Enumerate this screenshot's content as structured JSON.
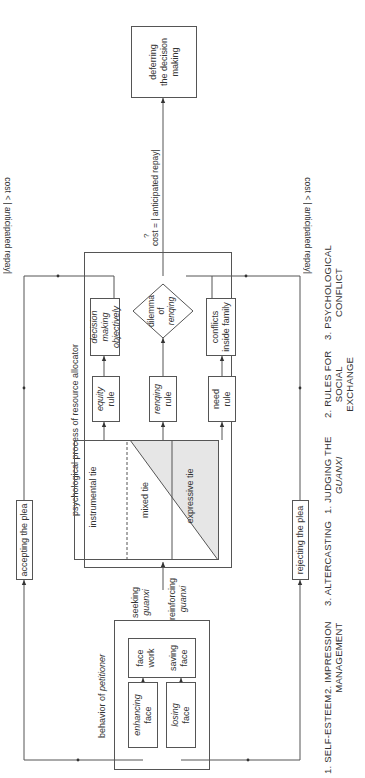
{
  "diagram": {
    "petitioner": {
      "title_prefix": "behavior of ",
      "title_italic": "petitioner",
      "enhancing_face": {
        "italic": "enhancing",
        "rest": "face"
      },
      "losing_face": {
        "italic": "losing",
        "rest": "face"
      },
      "face_work": "face work",
      "saving_face": "saving face"
    },
    "edges": {
      "seeking_1": "seeking",
      "seeking_2": "guanxi",
      "reinforcing_1": "reinforcing",
      "reinforcing_2": "guanxi",
      "accepting": "accepting the plea",
      "rejecting": "rejecting the plea",
      "cost_less_top": "cost < | anticipated repay|",
      "cost_less_bottom": "cost < | anticipated repay|",
      "cost_equal": "cost = | anticipated repay|",
      "cost_q": "?"
    },
    "allocator": {
      "title": "psychological process of resource allocator",
      "instrumental_tie": "instrumental tie",
      "mixed_tie": "mixed tie",
      "expressive_tie": "expressive tie",
      "equity_rule": {
        "italic": "equity",
        "rest": "rule"
      },
      "renqing_rule": {
        "italic": "renqing",
        "rest": "rule"
      },
      "need_rule": "need rule",
      "decision_objectively": "decision making objectively",
      "conflicts_family": "conflicts inside family",
      "dilemma": {
        "l1": "dilemma",
        "l2": "of",
        "l3": "renqing"
      }
    },
    "deferring": "deferring the decision making",
    "bottom_labels": {
      "c1": "1. SELF-ESTEEM",
      "c2a": "2. IMPRESSION",
      "c2b": "MANAGEMENT",
      "c3": "3. ALTERCASTING",
      "c4a": "1. JUDGING THE",
      "c4b": "GUANXI",
      "c5a": "2. RULES FOR",
      "c5b": "SOCIAL",
      "c5c": "EXCHANGE",
      "c6a": "3. PSYCHOLOGICAL",
      "c6b": "CONFLICT"
    }
  }
}
